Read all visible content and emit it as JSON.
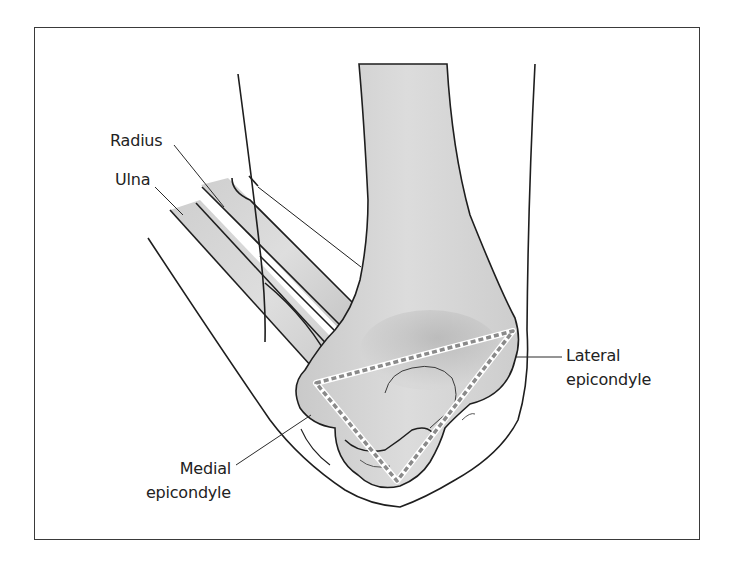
{
  "figure": {
    "colors": {
      "frame": "#3a3a3a",
      "outline": "#1e1e1e",
      "bone_fill": "#d4d4d4",
      "bone_shade": "#b9b9b9",
      "triangle_dash": "#8a8a8a",
      "label_text": "#222222"
    }
  },
  "labels": {
    "radius": "Radius",
    "ulna": "Ulna",
    "lateral_line1": "Lateral",
    "lateral_line2": "epicondyle",
    "medial_line1": "Medial",
    "medial_line2": "epicondyle"
  },
  "landmarks": {
    "triangle_vertices": [
      {
        "name": "medial-epicondyle",
        "x": 316,
        "y": 383
      },
      {
        "name": "lateral-epicondyle",
        "x": 513,
        "y": 331
      },
      {
        "name": "olecranon",
        "x": 397,
        "y": 481
      }
    ]
  }
}
